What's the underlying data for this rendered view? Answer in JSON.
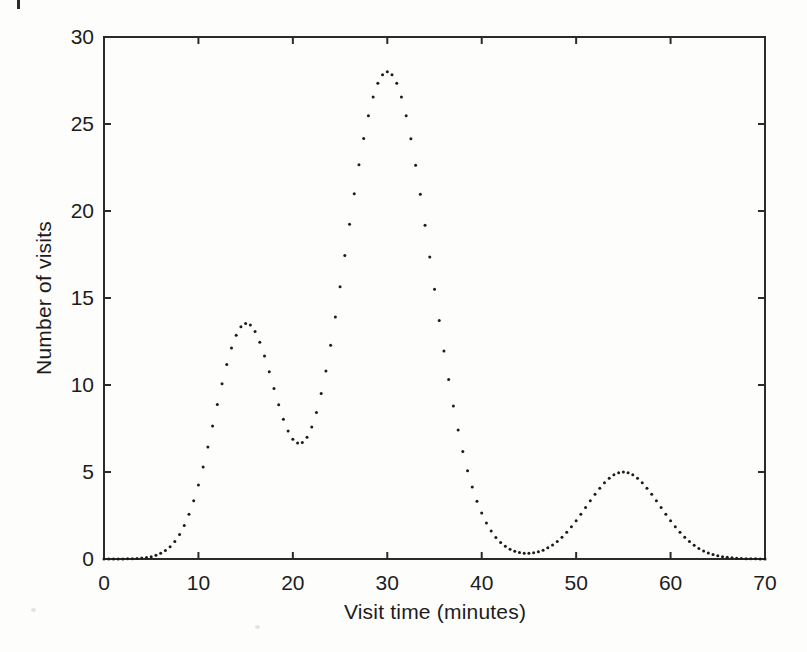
{
  "page": {
    "background_color": "#fdfdfc",
    "artifact": "partial cropped character at top-left page edge"
  },
  "chart_data": {
    "type": "scatter",
    "style": "dotted curve of small filled points (gnuplot-like), no connecting line",
    "title": "",
    "xlabel": "Visit time (minutes)",
    "ylabel": "Number of visits",
    "xlim": [
      0,
      70
    ],
    "ylim": [
      0,
      30
    ],
    "xticks": [
      0,
      10,
      20,
      30,
      40,
      50,
      60,
      70
    ],
    "yticks": [
      0,
      5,
      10,
      15,
      20,
      25,
      30
    ],
    "grid": false,
    "legend": "none",
    "frame": "full rectangular border with inward ticks mirrored on top and right edges",
    "marker": {
      "shape": "dot",
      "radius_px": 1.5,
      "color": "#1b1b1b"
    },
    "axis_color": "#2b2b2b",
    "sampling": {
      "x_start": 0,
      "x_end": 70,
      "x_step": 0.5
    },
    "model": {
      "type": "sum_of_gaussians",
      "components": [
        {
          "center": 15,
          "height": 13.4,
          "sigma": 3.3
        },
        {
          "center": 30,
          "height": 28.0,
          "sigma": 4.6
        },
        {
          "center": 55,
          "height": 5.0,
          "sigma": 3.9
        }
      ]
    },
    "key_features": [
      {
        "x": 15,
        "y": 13.6,
        "label": "first local peak"
      },
      {
        "x": 20.5,
        "y": 7.0,
        "label": "local minimum between first and second peaks"
      },
      {
        "x": 30,
        "y": 28.0,
        "label": "global maximum"
      },
      {
        "x": 45.5,
        "y": 0.4,
        "label": "near-zero trough"
      },
      {
        "x": 55,
        "y": 5.0,
        "label": "third small peak"
      },
      {
        "x": 70,
        "y": 0.0,
        "label": "curve returns to zero"
      }
    ],
    "values_at_5min": {
      "x": [
        0,
        5,
        10,
        15,
        20,
        25,
        30,
        35,
        40,
        45,
        50,
        55,
        60,
        65,
        70
      ],
      "y": [
        0.0,
        0.1,
        4.2,
        13.4,
        6.9,
        15.6,
        28.0,
        15.5,
        2.6,
        0.3,
        2.2,
        5.0,
        2.2,
        0.2,
        0.0
      ]
    }
  }
}
